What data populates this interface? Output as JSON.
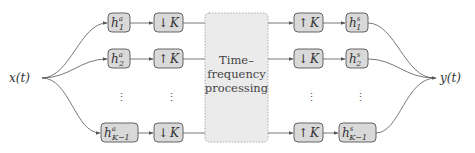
{
  "diagram": {
    "input_label": "x(t)",
    "output_label": "y(t)",
    "center_block": {
      "lines": [
        "Time–",
        "frequency",
        "processing"
      ]
    },
    "analysis_filters": [
      {
        "base": "h",
        "sub": "1",
        "sup": "a"
      },
      {
        "base": "h",
        "sub": "2",
        "sup": "a"
      },
      {
        "base": "h",
        "sub": "K−1",
        "sup": "a"
      }
    ],
    "analysis_resamplers": [
      {
        "arrow": "↓",
        "factor": "K"
      },
      {
        "arrow": "↑",
        "factor": "K"
      },
      {
        "arrow": "↓",
        "factor": "K"
      }
    ],
    "synthesis_resamplers": [
      {
        "arrow": "↑",
        "factor": "K"
      },
      {
        "arrow": "↓",
        "factor": "K"
      },
      {
        "arrow": "↑",
        "factor": "K"
      }
    ],
    "synthesis_filters": [
      {
        "base": "h",
        "sub": "1",
        "sup": "s"
      },
      {
        "base": "h",
        "sub": "2",
        "sup": "s"
      },
      {
        "base": "h",
        "sub": "K−1",
        "sup": "s"
      }
    ],
    "ellipsis": "⋮"
  }
}
